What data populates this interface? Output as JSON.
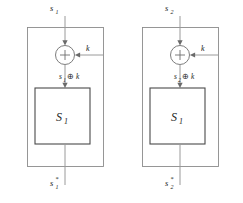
{
  "figure": {
    "type": "block-diagram",
    "background_color": "#ffffff",
    "line_color": "#9a9a9a",
    "box_color": "#4a4a4a",
    "text_color": "#1d1d1d"
  },
  "panels": [
    {
      "id": "panel-left",
      "input_label": "s",
      "input_sub": "1",
      "key_label": "k",
      "xor_symbol": "+",
      "intermediate_base": "s",
      "intermediate_sub": "1",
      "intermediate_oplus": "⊕",
      "intermediate_key": "k",
      "sbox_label": "S",
      "sbox_sub": "1",
      "output_label": "s",
      "output_sub": "1",
      "output_star": "*"
    },
    {
      "id": "panel-right",
      "input_label": "s",
      "input_sub": "2",
      "key_label": "k",
      "xor_symbol": "+",
      "intermediate_base": "s",
      "intermediate_sub": "2",
      "intermediate_oplus": "⊕",
      "intermediate_key": "k",
      "sbox_label": "S",
      "sbox_sub": "1",
      "output_label": "s",
      "output_sub": "2",
      "output_star": "*"
    }
  ]
}
